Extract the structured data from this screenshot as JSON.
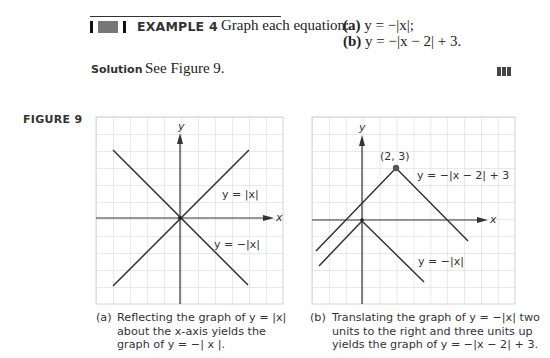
{
  "example": {
    "label": "EXAMPLE 4",
    "prompt": "Graph each equation:",
    "parts": [
      {
        "label": "(a)",
        "equation": "y = −|x|;"
      },
      {
        "label": "(b)",
        "equation": "y = −|x − 2| + 3."
      }
    ]
  },
  "solution": {
    "label": "Solution",
    "text": "See Figure 9."
  },
  "figure": {
    "label": "FIGURE 9",
    "panel_a": {
      "y_axis_label": "y",
      "x_axis_label": "x",
      "curve_labels": [
        "y = |x|",
        "y = −|x|"
      ],
      "caption_prefix": "(a)",
      "caption_lines": [
        "Reflecting the graph of y = |x|",
        "about the x-axis yields the",
        "graph of  y = −| x |."
      ]
    },
    "panel_b": {
      "y_axis_label": "y",
      "x_axis_label": "x",
      "point_label": "(2, 3)",
      "curve_labels": [
        "y = −|x − 2| + 3",
        "y = −|x|"
      ],
      "caption_prefix": "(b)",
      "caption_lines": [
        "Translating the graph of y = −|x| two",
        "units to the right and three units up",
        "yields the graph of y = −|x − 2| + 3."
      ]
    }
  },
  "colors": {
    "grid": "#d4d4d4",
    "curve": "#333333",
    "text": "#222222"
  }
}
